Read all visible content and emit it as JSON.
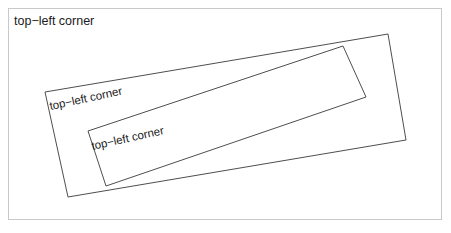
{
  "canvas": {
    "width": 451,
    "height": 233,
    "background_color": "#ffffff",
    "border_color": "#c9c9c9"
  },
  "graphic": {
    "type": "vector-figure",
    "description": "Three nested top-left corner labels anchored to progressively rotated rectangles",
    "stroke_color": "#3a3a3a",
    "stroke_width": 0.9,
    "fill": "none",
    "labels": [
      {
        "id": "label-0",
        "text": "top−left corner",
        "rotation_deg": 0,
        "anchor_x": 14,
        "anchor_y": 15,
        "font_size": 12.5
      },
      {
        "id": "label-1",
        "text": "top−left corner",
        "rotation_deg": -12.2,
        "anchor_x": 51,
        "anchor_y": 101,
        "font_size": 11.5
      },
      {
        "id": "label-2",
        "text": "top−left corner",
        "rotation_deg": -12.6,
        "anchor_x": 93,
        "anchor_y": 141,
        "font_size": 11.5
      }
    ],
    "rectangles": [
      {
        "id": "rect-outer",
        "rotation_deg": -12.2,
        "points": "45,92 388,34 406,140 68,197"
      },
      {
        "id": "rect-inner",
        "rotation_deg": -12.6,
        "points": "88,131 343,46 366,97 106,186"
      }
    ]
  }
}
